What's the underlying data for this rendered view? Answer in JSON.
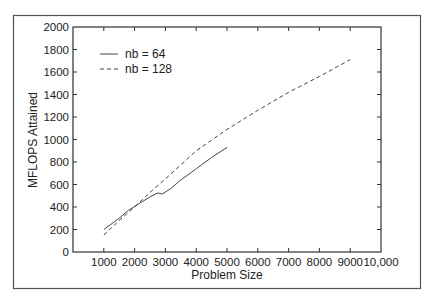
{
  "chart_data": {
    "type": "line",
    "title": "",
    "xlabel": "Problem Size",
    "ylabel": "MFLOPS Attained",
    "xlim": [
      0,
      10000
    ],
    "ylim": [
      0,
      2000
    ],
    "xticks": [
      1000,
      2000,
      3000,
      4000,
      5000,
      6000,
      7000,
      8000,
      9000,
      10000
    ],
    "xtick_labels": [
      "1000",
      "2000",
      "3000",
      "4000",
      "5000",
      "6000",
      "7000",
      "8000",
      "9000",
      "10,000"
    ],
    "yticks": [
      0,
      200,
      400,
      600,
      800,
      1000,
      1200,
      1400,
      1600,
      1800,
      2000
    ],
    "ytick_labels": [
      "0",
      "200",
      "400",
      "600",
      "800",
      "1000",
      "1200",
      "1400",
      "1600",
      "1800",
      "2000"
    ],
    "grid": false,
    "legend_position": "upper left",
    "series": [
      {
        "name": "nb = 64",
        "style": "solid",
        "x": [
          1000,
          1500,
          1800,
          2200,
          2500,
          2750,
          2900,
          3200,
          3500,
          4000,
          4500,
          5000
        ],
        "y": [
          200,
          300,
          370,
          440,
          490,
          525,
          515,
          570,
          640,
          740,
          840,
          930
        ]
      },
      {
        "name": "nb = 128",
        "style": "dashed",
        "x": [
          1000,
          1500,
          2000,
          2500,
          3000,
          4000,
          5000,
          6000,
          7000,
          8000,
          9000
        ],
        "y": [
          150,
          280,
          400,
          530,
          650,
          900,
          1090,
          1260,
          1420,
          1560,
          1710
        ]
      }
    ]
  }
}
